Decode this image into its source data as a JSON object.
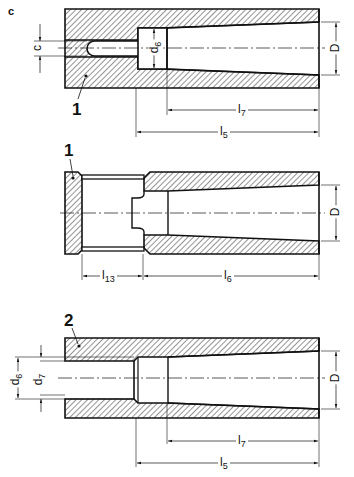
{
  "figure": {
    "panel_letter": "c",
    "views": [
      {
        "id": "view-top",
        "part_labels": [
          {
            "text": "1"
          }
        ],
        "dimensions": {
          "slot_width": {
            "symbol": "c"
          },
          "bore_small": {
            "symbol": "d",
            "sub": "6"
          },
          "taper_diameter": {
            "symbol": "D"
          },
          "taper_length": {
            "symbol": "l",
            "sub": "7"
          },
          "total_length": {
            "symbol": "l",
            "sub": "5"
          }
        }
      },
      {
        "id": "view-middle",
        "part_labels": [
          {
            "text": "1"
          }
        ],
        "dimensions": {
          "taper_diameter": {
            "symbol": "D"
          },
          "recess_length": {
            "symbol": "l",
            "sub": "13"
          },
          "taper_length": {
            "symbol": "l",
            "sub": "6"
          }
        }
      },
      {
        "id": "view-bottom",
        "part_labels": [
          {
            "text": "2"
          }
        ],
        "dimensions": {
          "outer_bore": {
            "symbol": "d",
            "sub": "6"
          },
          "inner_bore": {
            "symbol": "d",
            "sub": "7"
          },
          "taper_diameter": {
            "symbol": "D"
          },
          "taper_length": {
            "symbol": "l",
            "sub": "7"
          },
          "total_length": {
            "symbol": "l",
            "sub": "5"
          }
        }
      }
    ]
  },
  "colors": {
    "ink": "#111111",
    "background": "#ffffff"
  }
}
